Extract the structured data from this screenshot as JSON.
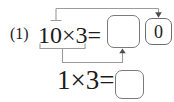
{
  "colors": {
    "background": "#ffffff",
    "text": "#1c1c1c",
    "connector_line": "#9b9b9b",
    "arrowhead": "#4d4d4d",
    "answer_box_border": "#7a7a7a"
  },
  "exercise": {
    "number": "(1)",
    "main_row": {
      "expression": "10×3=",
      "answer_box_value": "",
      "carry_box_value": "0"
    },
    "helper_row": {
      "expression": "1×3=",
      "answer_box_value": ""
    }
  }
}
